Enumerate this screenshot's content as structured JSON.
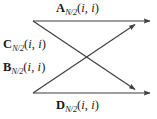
{
  "figure": {
    "type": "butterfly-signal-flow-diagram",
    "colors": {
      "line": "#3d3d3d",
      "text": "#1a1a1a",
      "background": "#ffffff"
    },
    "labels": {
      "top": {
        "id": "label-a",
        "symbol": "A",
        "subscript": "N/2",
        "open_paren": "(",
        "arg1": "i",
        "comma": ", ",
        "arg2": "i",
        "close_paren": ")",
        "plain": "A_{N/2}(i, i)"
      },
      "upper_left": {
        "id": "label-c",
        "symbol": "C",
        "subscript": "N/2",
        "open_paren": "(",
        "arg1": "i",
        "comma": ", ",
        "arg2": "i",
        "close_paren": ")",
        "plain": "C_{N/2}(i, i)"
      },
      "lower_left": {
        "id": "label-b",
        "symbol": "B",
        "subscript": "N/2",
        "open_paren": "(",
        "arg1": "i",
        "comma": ", ",
        "arg2": "i",
        "close_paren": ")",
        "plain": "B_{N/2}(i, i)"
      },
      "bottom": {
        "id": "label-d",
        "symbol": "D",
        "subscript": "N/2",
        "open_paren": "(",
        "arg1": "i",
        "comma": ", ",
        "arg2": "i",
        "close_paren": ")",
        "plain": "D_{N/2}(i, i)"
      }
    },
    "edges": [
      {
        "name": "top-horizontal-edge",
        "from": [
          33,
          21
        ],
        "to": [
          152,
          21
        ],
        "arrow": "end"
      },
      {
        "name": "bottom-horizontal-edge",
        "from": [
          33,
          93
        ],
        "to": [
          152,
          93
        ],
        "arrow": "end"
      },
      {
        "name": "diagonal-down-edge",
        "from": [
          33,
          21
        ],
        "to": [
          137,
          91
        ],
        "arrow": "end"
      },
      {
        "name": "diagonal-up-edge",
        "from": [
          33,
          93
        ],
        "to": [
          137,
          23
        ],
        "arrow": "end"
      }
    ]
  }
}
